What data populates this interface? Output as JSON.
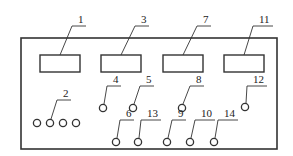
{
  "diagram": {
    "type": "front-panel-schematic",
    "colors": {
      "line": "#333333",
      "background": "#ffffff",
      "text": "#222222"
    },
    "panel": {
      "x": 21,
      "y": 38,
      "w": 256,
      "h": 111
    },
    "displays": [
      {
        "id": "1",
        "label": "1",
        "x": 40,
        "y": 55,
        "w": 40,
        "h": 17,
        "lx": 78,
        "ly": 23
      },
      {
        "id": "3",
        "label": "3",
        "x": 101,
        "y": 55,
        "w": 40,
        "h": 17,
        "lx": 141,
        "ly": 23
      },
      {
        "id": "7",
        "label": "7",
        "x": 163,
        "y": 55,
        "w": 40,
        "h": 17,
        "lx": 203,
        "ly": 23
      },
      {
        "id": "11",
        "label": "11",
        "x": 224,
        "y": 55,
        "w": 40,
        "h": 17,
        "lx": 259,
        "ly": 23
      }
    ],
    "terminal_group": {
      "id": "2",
      "label": "2",
      "circles": [
        [
          37,
          123
        ],
        [
          50,
          123
        ],
        [
          63,
          123
        ],
        [
          76,
          123
        ]
      ],
      "lx": 63,
      "ly": 97
    },
    "terminals": [
      {
        "id": "4",
        "label": "4",
        "cx": 103,
        "cy": 108,
        "lx": 113,
        "ly": 83
      },
      {
        "id": "5",
        "label": "5",
        "cx": 133,
        "cy": 108,
        "lx": 146,
        "ly": 83
      },
      {
        "id": "8",
        "label": "8",
        "cx": 182,
        "cy": 108,
        "lx": 196,
        "ly": 83
      },
      {
        "id": "12",
        "label": "12",
        "cx": 245,
        "cy": 107,
        "lx": 253,
        "ly": 83
      },
      {
        "id": "6",
        "label": "6",
        "cx": 116,
        "cy": 142,
        "lx": 126,
        "ly": 117
      },
      {
        "id": "13",
        "label": "13",
        "cx": 138,
        "cy": 142,
        "lx": 147,
        "ly": 117
      },
      {
        "id": "9",
        "label": "9",
        "cx": 167,
        "cy": 142,
        "lx": 178,
        "ly": 117
      },
      {
        "id": "10",
        "label": "10",
        "cx": 190,
        "cy": 142,
        "lx": 201,
        "ly": 117
      },
      {
        "id": "14",
        "label": "14",
        "cx": 214,
        "cy": 142,
        "lx": 224,
        "ly": 117
      }
    ]
  }
}
